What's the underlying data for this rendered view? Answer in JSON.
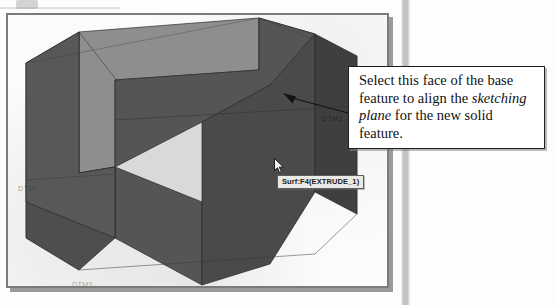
{
  "figure": {
    "kind": "cad-viewport-figure",
    "application_hint": "3D solid modeling viewport"
  },
  "viewport": {
    "background_color": "#fbfbfa",
    "border_color": "#7b7b7b",
    "model": {
      "name": "EXTRUDE_1",
      "shape": "U-shaped (arch) extruded solid",
      "projection": "isometric",
      "face_colors": {
        "top": "#8d8d8d",
        "front_left": "#6f6f6f",
        "front_right": "#4f4f4f",
        "inner_left": "#565656",
        "inner_right": "#5c5c5c",
        "side_dark": "#3f3f3f"
      },
      "edge_color": "#2a2a2a"
    }
  },
  "datum_planes": [
    {
      "id": "dtm1",
      "label": "DTM1"
    },
    {
      "id": "dtm2",
      "label": "DTM2"
    },
    {
      "id": "dtm3",
      "label": "DTM3"
    }
  ],
  "selection": {
    "tooltip": "Surf:F4(EXTRUDE_1)",
    "cursor_icon": "arrow-pointer-icon"
  },
  "callout": {
    "line1": "Select this face of the base",
    "line2_pre": "feature to align the ",
    "line2_em": "sketching",
    "line3_em": "plane",
    "line3_post": " for the new solid",
    "line4": "feature.",
    "full_text": "Select this face of the base feature to align the sketching plane for the new solid feature.",
    "border_color": "#1e1e1e",
    "background_color": "#ffffff"
  }
}
